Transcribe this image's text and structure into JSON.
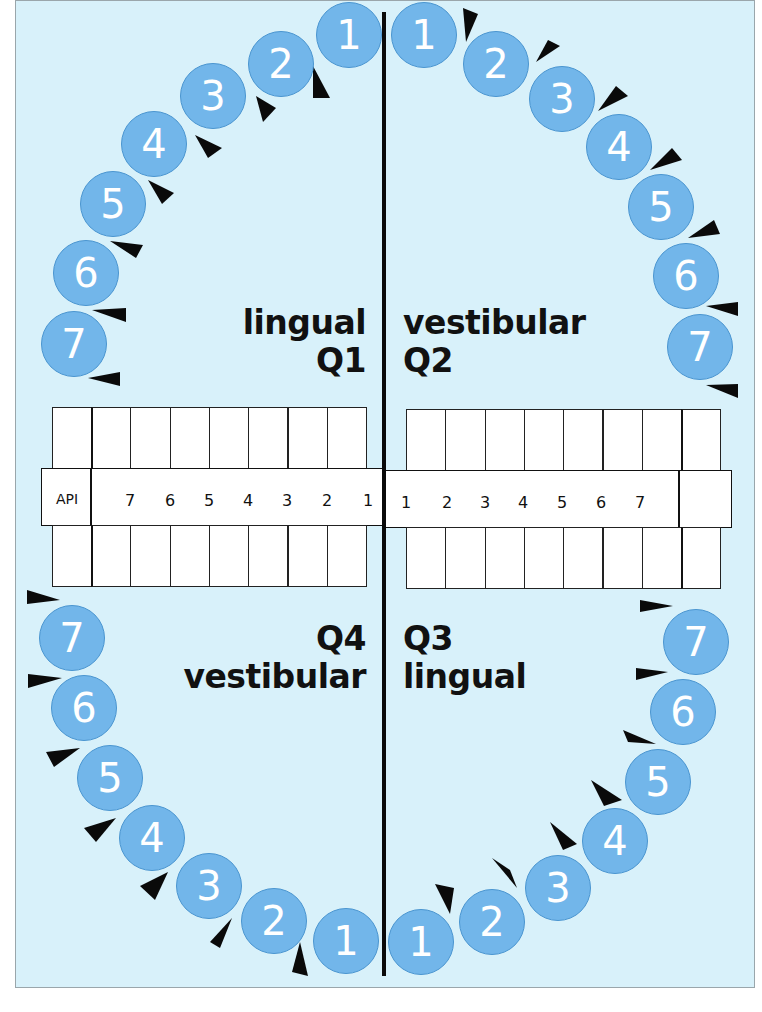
{
  "labels": {
    "q1_surface": "lingual",
    "q1_name": "Q1",
    "q2_surface": "vestibular",
    "q2_name": "Q2",
    "q3_name": "Q3",
    "q3_surface": "lingual",
    "q4_name": "Q4",
    "q4_surface": "vestibular",
    "api": "API"
  },
  "colors": {
    "background": "#d8f1fa",
    "tooth_fill": "#72b6ea",
    "tooth_stroke": "#4a95d0",
    "tooth_text": "#ffffff",
    "line": "#0a0a0a"
  },
  "teeth": {
    "q1": [
      {
        "n": "1",
        "x": 316,
        "y": 2
      },
      {
        "n": "2",
        "x": 248,
        "y": 31
      },
      {
        "n": "3",
        "x": 180,
        "y": 63
      },
      {
        "n": "4",
        "x": 121,
        "y": 111
      },
      {
        "n": "5",
        "x": 80,
        "y": 171
      },
      {
        "n": "6",
        "x": 53,
        "y": 240
      },
      {
        "n": "7",
        "x": 41,
        "y": 311
      }
    ],
    "q2": [
      {
        "n": "1",
        "x": 391,
        "y": 2
      },
      {
        "n": "2",
        "x": 463,
        "y": 31
      },
      {
        "n": "3",
        "x": 529,
        "y": 66
      },
      {
        "n": "4",
        "x": 586,
        "y": 114
      },
      {
        "n": "5",
        "x": 628,
        "y": 174
      },
      {
        "n": "6",
        "x": 653,
        "y": 243
      },
      {
        "n": "7",
        "x": 667,
        "y": 314
      }
    ],
    "q4": [
      {
        "n": "7",
        "x": 39,
        "y": 605
      },
      {
        "n": "6",
        "x": 51,
        "y": 675
      },
      {
        "n": "5",
        "x": 77,
        "y": 745
      },
      {
        "n": "4",
        "x": 119,
        "y": 805
      },
      {
        "n": "3",
        "x": 176,
        "y": 853
      },
      {
        "n": "2",
        "x": 241,
        "y": 888
      },
      {
        "n": "1",
        "x": 313,
        "y": 908
      }
    ],
    "q3": [
      {
        "n": "7",
        "x": 663,
        "y": 609
      },
      {
        "n": "6",
        "x": 650,
        "y": 679
      },
      {
        "n": "5",
        "x": 625,
        "y": 749
      },
      {
        "n": "4",
        "x": 582,
        "y": 808
      },
      {
        "n": "3",
        "x": 525,
        "y": 855
      },
      {
        "n": "2",
        "x": 459,
        "y": 889
      },
      {
        "n": "1",
        "x": 388,
        "y": 909
      }
    ]
  },
  "arrows": [
    {
      "pts": "313,66 330,98 313,98"
    },
    {
      "pts": "256,96 276,108 263,122"
    },
    {
      "pts": "195,135 222,148 208,158"
    },
    {
      "pts": "148,180 174,193 162,204"
    },
    {
      "pts": "110,241 143,245 136,258"
    },
    {
      "pts": "92,310 126,308 126,322"
    },
    {
      "pts": "88,378 120,372 120,386"
    },
    {
      "pts": "463,8 478,14 466,42"
    },
    {
      "pts": "536,62 560,46 548,40"
    },
    {
      "pts": "598,111 628,96 616,86"
    },
    {
      "pts": "650,170 682,160 672,148"
    },
    {
      "pts": "688,238 720,234 714,220"
    },
    {
      "pts": "706,306 738,316 738,302"
    },
    {
      "pts": "706,385 738,398 738,384"
    },
    {
      "pts": "27,590 60,600 27,604"
    },
    {
      "pts": "28,674 62,678 28,688"
    },
    {
      "pts": "46,752 80,748 54,767"
    },
    {
      "pts": "84,828 116,818 96,842"
    },
    {
      "pts": "140,886 168,872 155,900"
    },
    {
      "pts": "210,942 232,918 220,948"
    },
    {
      "pts": "292,972 300,942 308,976"
    },
    {
      "pts": "640,600 673,606 640,612"
    },
    {
      "pts": "636,668 668,672 636,680"
    },
    {
      "pts": "623,730 656,744 628,742"
    },
    {
      "pts": "591,780 622,800 604,806"
    },
    {
      "pts": "550,822 577,844 563,850"
    },
    {
      "pts": "492,858 517,888 510,870"
    },
    {
      "pts": "435,884 450,914 454,888"
    }
  ],
  "table": {
    "left_numbers": [
      "7",
      "6",
      "5",
      "4",
      "3",
      "2",
      "1"
    ],
    "right_numbers": [
      "1",
      "2",
      "3",
      "4",
      "5",
      "6",
      "7"
    ]
  }
}
